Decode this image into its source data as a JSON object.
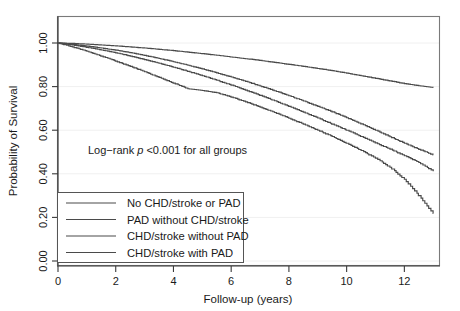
{
  "chart_data": {
    "type": "line",
    "title": "",
    "xlabel": "Follow-up (years)",
    "ylabel": "Probability of Survival",
    "xlim": [
      0,
      13.2
    ],
    "ylim": [
      0.0,
      1.05
    ],
    "xticks": [
      "0",
      "2",
      "4",
      "6",
      "8",
      "10",
      "12"
    ],
    "xtick_values": [
      0,
      2,
      4,
      6,
      8,
      10,
      12
    ],
    "yticks": [
      "0.00",
      "0.20",
      "0.40",
      "0.60",
      "0.80",
      "1.00"
    ],
    "ytick_values": [
      0.0,
      0.2,
      0.4,
      0.6,
      0.8,
      1.0
    ],
    "grid": true,
    "legend_position": "bottom-left",
    "annotations": [
      {
        "id": "logrank",
        "text_prefix": "Log−rank ",
        "text_italic": "p",
        "text_suffix": " <0.001 for all groups",
        "x": 1.1,
        "y": 0.47
      }
    ],
    "series": [
      {
        "name": "No CHD/stroke or PAD",
        "color": "#4a4a4a",
        "x": [
          0,
          0.5,
          1,
          1.5,
          2,
          2.5,
          3,
          3.5,
          4,
          4.5,
          5,
          5.5,
          6,
          6.5,
          7,
          7.5,
          8,
          8.5,
          9,
          9.5,
          10,
          10.5,
          11,
          11.5,
          12,
          12.5,
          13
        ],
        "y": [
          1.0,
          0.998,
          0.995,
          0.991,
          0.987,
          0.982,
          0.977,
          0.971,
          0.965,
          0.958,
          0.951,
          0.944,
          0.936,
          0.928,
          0.92,
          0.911,
          0.902,
          0.893,
          0.883,
          0.873,
          0.862,
          0.85,
          0.838,
          0.826,
          0.814,
          0.804,
          0.796
        ]
      },
      {
        "name": "PAD without CHD/stroke",
        "color": "#4a4a4a",
        "x": [
          0,
          0.5,
          1,
          1.5,
          2,
          2.5,
          3,
          3.5,
          4,
          4.5,
          5,
          5.5,
          6,
          6.5,
          7,
          7.5,
          8,
          8.5,
          9,
          9.5,
          10,
          10.5,
          11,
          11.5,
          12,
          12.5,
          13
        ],
        "y": [
          1.0,
          0.994,
          0.986,
          0.977,
          0.967,
          0.956,
          0.943,
          0.929,
          0.914,
          0.898,
          0.881,
          0.863,
          0.844,
          0.824,
          0.803,
          0.781,
          0.758,
          0.734,
          0.709,
          0.684,
          0.657,
          0.629,
          0.6,
          0.57,
          0.54,
          0.512,
          0.487
        ]
      },
      {
        "name": "CHD/stroke without PAD",
        "color": "#4a4a4a",
        "x": [
          0,
          0.5,
          1,
          1.5,
          2,
          2.5,
          3,
          3.5,
          4,
          4.5,
          5,
          5.5,
          6,
          6.5,
          7,
          7.5,
          8,
          8.5,
          9,
          9.5,
          10,
          10.5,
          11,
          11.5,
          12,
          12.5,
          13
        ],
        "y": [
          1.0,
          0.991,
          0.98,
          0.968,
          0.955,
          0.94,
          0.924,
          0.907,
          0.889,
          0.87,
          0.85,
          0.829,
          0.807,
          0.784,
          0.76,
          0.735,
          0.709,
          0.683,
          0.656,
          0.628,
          0.6,
          0.571,
          0.542,
          0.513,
          0.483,
          0.452,
          0.412
        ]
      },
      {
        "name": "CHD/stroke with PAD",
        "color": "#4a4a4a",
        "x": [
          0,
          0.5,
          1,
          1.5,
          2,
          2.5,
          3,
          3.5,
          4,
          4.5,
          5,
          5.5,
          6,
          6.5,
          7,
          7.5,
          8,
          8.5,
          9,
          9.5,
          10,
          10.5,
          11,
          11.5,
          12,
          12.5,
          13
        ],
        "y": [
          1.0,
          0.982,
          0.962,
          0.94,
          0.917,
          0.893,
          0.868,
          0.842,
          0.816,
          0.79,
          0.782,
          0.772,
          0.752,
          0.73,
          0.706,
          0.681,
          0.655,
          0.628,
          0.6,
          0.571,
          0.54,
          0.507,
          0.472,
          0.43,
          0.375,
          0.3,
          0.218
        ]
      }
    ]
  },
  "legend": {
    "entries": [
      {
        "label": "No CHD/stroke or PAD"
      },
      {
        "label": "PAD without CHD/stroke"
      },
      {
        "label": "CHD/stroke without PAD"
      },
      {
        "label": "CHD/stroke with PAD"
      }
    ]
  }
}
